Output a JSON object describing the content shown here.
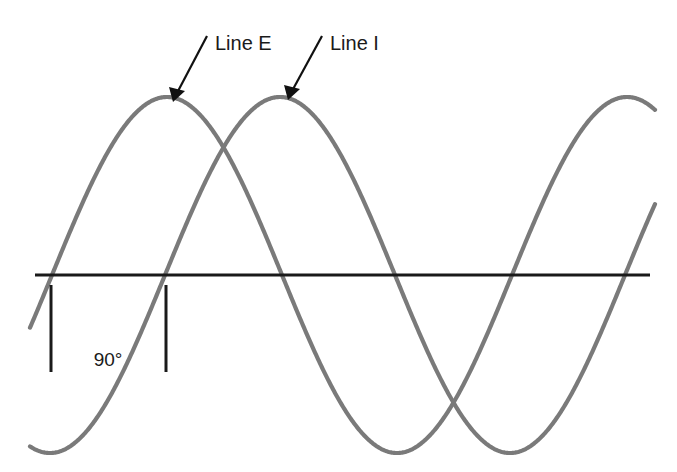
{
  "figure": {
    "name": "phase-shift-sine-waves",
    "background_color": "#ffffff",
    "labels": {
      "line_e": "Line E",
      "line_i": "Line I",
      "angle": "90°"
    },
    "colors": {
      "wave": "#7a7a7a",
      "axis": "#1a1a1a",
      "tick": "#1a1a1a",
      "leader": "#111111",
      "text": "#1a1a1a"
    },
    "typography": {
      "label_font_size": "20px",
      "angle_font_size": "19px"
    }
  },
  "chart_data": {
    "type": "line",
    "title": "",
    "subtitle": "",
    "xlabel": "",
    "ylabel": "",
    "grid": false,
    "legend_position": "inline-annotations",
    "axis": {
      "baseline_y_px": 275,
      "x_start_px": 35,
      "x_end_px": 650,
      "degrees_per_px": 0.7826,
      "amplitude_px": 178,
      "period_px": 460
    },
    "x_degrees": [
      0,
      45,
      90,
      135,
      180,
      225,
      270,
      315,
      360,
      405,
      450,
      495,
      540
    ],
    "series": [
      {
        "name": "Line E",
        "label": "Line E",
        "phase_deg": 0,
        "amplitude": 1.0,
        "color": "#7a7a7a",
        "values": [
          0,
          0.707,
          1.0,
          0.707,
          0,
          -0.707,
          -1.0,
          -0.707,
          0,
          0.707,
          1.0,
          0.707,
          0
        ],
        "annotation": {
          "text": "Line E",
          "text_x_px": 215,
          "text_y_px": 50,
          "arrow_from_px": [
            207,
            36
          ],
          "arrow_to_px": [
            173,
            100
          ]
        },
        "zero_crossing_px": 52,
        "peak_px": [
          165,
          97
        ]
      },
      {
        "name": "Line I",
        "label": "Line I",
        "phase_deg": -90,
        "amplitude": 1.0,
        "color": "#7a7a7a",
        "values": [
          -1.0,
          -0.707,
          0,
          0.707,
          1.0,
          0.707,
          0,
          -0.707,
          -1.0,
          -0.707,
          0,
          0.707,
          1.0
        ],
        "annotation": {
          "text": "Line I",
          "text_x_px": 330,
          "text_y_px": 50,
          "arrow_from_px": [
            322,
            36
          ],
          "arrow_to_px": [
            288,
            100
          ]
        },
        "zero_crossing_px": 165,
        "peak_px": [
          272,
          97
        ]
      }
    ],
    "annotations": [
      {
        "name": "phase-difference",
        "text": "90°",
        "value_deg": 90,
        "tick_x_px": [
          51,
          166
        ],
        "tick_top_px": 285,
        "tick_bottom_px": 372,
        "text_x_px": 108,
        "text_y_px": 366
      }
    ]
  }
}
